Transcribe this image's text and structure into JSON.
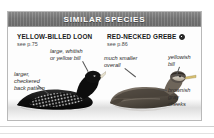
{
  "header": {
    "title": "SIMILAR SPECIES"
  },
  "species": [
    {
      "name": "YELLOW-BILLED LOON",
      "page_ref": "see p.75",
      "has_range_badge": false,
      "illustration": "yellow-billed-loon-swimming",
      "annotations": [
        {
          "id": "bill-left",
          "text": "large, whitish\nor yellow bill"
        },
        {
          "id": "back-left",
          "text": "larger,\ncheckered\nback pattern"
        }
      ]
    },
    {
      "name": "RED-NECKED GREBE",
      "page_ref": "see p.86",
      "has_range_badge": true,
      "illustration": "red-necked-grebe-swimming",
      "annotations": [
        {
          "id": "smaller",
          "text": "much smaller\noverall"
        },
        {
          "id": "bill-right",
          "text": "yellowish\nbill"
        },
        {
          "id": "cheeks",
          "text": "brownish\ngray\ncheeks"
        }
      ]
    }
  ],
  "colors": {
    "header_bar": "#787878",
    "header_text": "#ffffff",
    "panel_border": "#b9b9b9",
    "title_text": "#1a1a1a",
    "annotation_text": "#2b2b2b",
    "page_background": "#ffffff",
    "loon_body": "#141414",
    "grebe_body": "#6b6257"
  }
}
